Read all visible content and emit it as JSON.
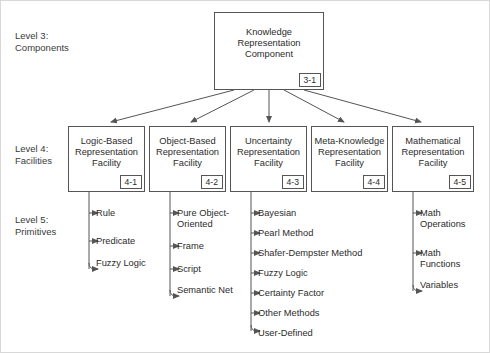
{
  "diagram": {
    "levels": [
      {
        "id": "level-3",
        "label": "Level 3:\nComponents"
      },
      {
        "id": "level-4",
        "label": "Level 4:\nFacilities"
      },
      {
        "id": "level-5",
        "label": "Level 5:\nPrimitives"
      }
    ],
    "root": {
      "title": "Knowledge\nRepresentation\nComponent",
      "badge": "3-1"
    },
    "facilities": [
      {
        "title": "Logic-Based\nRepresentation\nFacility",
        "badge": "4-1",
        "primitives": [
          "Rule",
          "Predicate",
          "Fuzzy Logic"
        ]
      },
      {
        "title": "Object-Based\nRepresentation\nFacility",
        "badge": "4-2",
        "primitives": [
          "Pure Object-\nOriented",
          "Frame",
          "Script",
          "Semantic Net"
        ]
      },
      {
        "title": "Uncertainty\nRepresentation\nFacility",
        "badge": "4-3",
        "primitives": [
          "Bayesian",
          "Pearl Method",
          "Shafer-Dempster Method",
          "Fuzzy Logic",
          "Certainty Factor",
          "Other Methods",
          "User-Defined"
        ]
      },
      {
        "title": "Meta-Knowledge\nRepresentation\nFacility",
        "badge": "4-4",
        "primitives": []
      },
      {
        "title": "Mathematical\nRepresentation\nFacility",
        "badge": "4-5",
        "primitives": [
          "Math\nOperations",
          "Math\nFunctions",
          "Variables"
        ]
      }
    ],
    "colors": {
      "line": "#555555",
      "text": "#2b2b2b",
      "background": "#ffffff",
      "frame": "#d8d8d8"
    }
  }
}
